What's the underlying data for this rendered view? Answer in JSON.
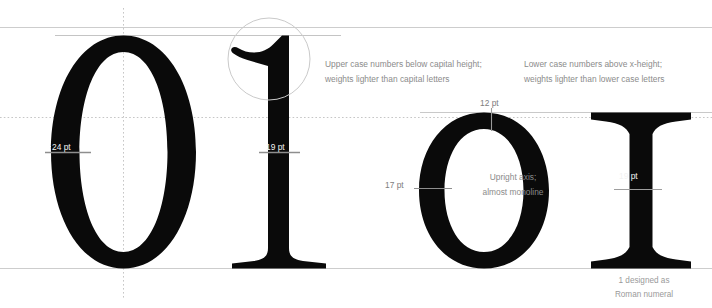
{
  "figure": {
    "background_color": "#ffffff",
    "glyph_color": "#0a0a0a",
    "guide_color": "#cfcfcf",
    "annotation_color": "#8b8b8b"
  },
  "annotations": {
    "upper_case_numbers": {
      "line1": "Upper case numbers below capital height;",
      "line2": "weights lighter than capital letters"
    },
    "lower_case_numbers": {
      "line1": "Lower case numbers above x-height;",
      "line2": "weights lighter than lower case letters"
    },
    "axis": {
      "line1": "Upright axis;",
      "line2": "almost monoline"
    },
    "roman_numeral": {
      "line1": "1 designed as",
      "line2": "Roman numeral"
    }
  },
  "measurements": [
    {
      "id": "zero-cap-stroke",
      "label": "24 pt",
      "on": "dark"
    },
    {
      "id": "one-stem",
      "label": "19 pt",
      "on": "dark"
    },
    {
      "id": "o-top-stroke",
      "label": "12 pt",
      "on": "light"
    },
    {
      "id": "o-side-stroke",
      "label": "17 pt",
      "on": "light"
    },
    {
      "id": "i-stem",
      "label": "19 pt",
      "on": "dark"
    }
  ],
  "glyphs": [
    {
      "id": "capital-zero",
      "character": "0",
      "case": "upper"
    },
    {
      "id": "capital-one",
      "character": "1",
      "case": "upper"
    },
    {
      "id": "lowercase-o",
      "character": "o",
      "case": "lower"
    },
    {
      "id": "lowercase-i",
      "character": "I",
      "case": "lower"
    }
  ],
  "guides": {
    "cap_height": "cap-height-line",
    "figure_height": "figure-height-line",
    "x_height": "x-height-line",
    "baseline": "baseline",
    "vertical_axis": "vertical-center-axis",
    "highlight": "flag-detail-circle"
  }
}
